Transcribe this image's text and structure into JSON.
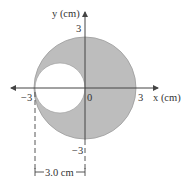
{
  "diagram": {
    "type": "disk-with-hole",
    "axes": {
      "x_label": "x (cm)",
      "y_label": "y (cm)",
      "x_ticks": [
        "-3",
        "0",
        "3"
      ],
      "y_ticks": [
        "3",
        "-3"
      ]
    },
    "large_disk": {
      "center": [
        0,
        0
      ],
      "radius_cm": 3,
      "fill": "#bdbdbd"
    },
    "hole": {
      "center": [
        -1.5,
        0
      ],
      "radius_cm": 1.5,
      "fill": "#ffffff"
    },
    "dimension": {
      "label": "3.0 cm"
    },
    "colors": {
      "shade": "#bdbdbd",
      "line": "#444444",
      "text": "#333333"
    }
  }
}
